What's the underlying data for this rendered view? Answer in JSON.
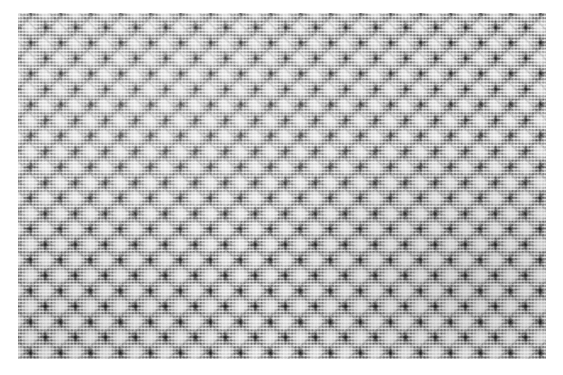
{
  "image": {
    "subject": "woven-fabric-texture",
    "description": "Close-up photograph of a grey woven textile with a repeating geometric weave pattern",
    "canvas": {
      "width": 563,
      "height": 375,
      "background_color": "#ffffff"
    },
    "swatch": {
      "left": 18,
      "top": 13,
      "width": 528,
      "height": 346,
      "base_color": "#a9a9a9",
      "highlight_color": "#f4f4f4",
      "shadow_color": "#1e1e1e",
      "midtone_color": "#8c8c8c"
    },
    "weave": {
      "thread_pitch_px": 3.4,
      "motif_pitch_x_px": 30,
      "motif_pitch_y_px": 31,
      "motif_columns": 18,
      "motif_rows": 11,
      "structure": "plain-weave ground with light square float islands and dark bowtie junctions",
      "diagonal_period_px": 21.2
    }
  }
}
